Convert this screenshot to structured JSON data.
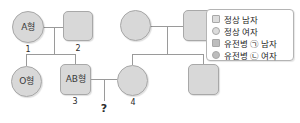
{
  "pedigree": {
    "individuals": [
      {
        "id": "i1",
        "sex": "female",
        "shape": "circle",
        "label": "A형",
        "number": "1",
        "affected": false
      },
      {
        "id": "i2",
        "sex": "male",
        "shape": "square",
        "label": "",
        "number": "2",
        "affected": false
      },
      {
        "id": "i3",
        "sex": "female",
        "shape": "circle",
        "label": "O형",
        "number": "",
        "affected": false
      },
      {
        "id": "i4",
        "sex": "male",
        "shape": "square",
        "label": "AB형",
        "number": "3",
        "affected": false
      },
      {
        "id": "i5",
        "sex": "female",
        "shape": "circle",
        "label": "",
        "number": "",
        "affected": false
      },
      {
        "id": "i6",
        "sex": "male",
        "shape": "square",
        "label": "",
        "number": "",
        "affected": false
      },
      {
        "id": "i7",
        "sex": "female",
        "shape": "circle",
        "label": "",
        "number": "4",
        "affected": false
      },
      {
        "id": "i8",
        "sex": "male",
        "shape": "square",
        "label": "",
        "number": "",
        "affected": false
      }
    ],
    "unknown_offspring_marker": "?"
  },
  "legend": {
    "items": [
      {
        "symbol": "square",
        "affected": false,
        "text": "정상 남자"
      },
      {
        "symbol": "circle",
        "affected": false,
        "text": "정상 여자"
      },
      {
        "symbol": "square",
        "affected": true,
        "text": "유전병 ㉠ 남자"
      },
      {
        "symbol": "circle",
        "affected": true,
        "text": "유전병 ㉡ 여자"
      }
    ]
  },
  "colors": {
    "symbol_fill": "#d8d8d8",
    "symbol_border": "#a8a8a8",
    "line": "#9a9a9a",
    "text": "#2b2b2b",
    "legend_border": "#b4b4b4"
  }
}
